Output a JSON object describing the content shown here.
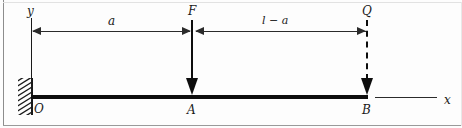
{
  "figure": {
    "kind": "cantilever-beam-free-body-diagram",
    "colors": {
      "line": "#0d0d0d",
      "dimension": "#2b2b2b",
      "frame": "#8d8d8d",
      "background": "#fdfdfd"
    }
  },
  "axes": {
    "y_label": "y",
    "x_label": "x",
    "origin_label": "O"
  },
  "points": {
    "a_label": "A",
    "b_label": "B"
  },
  "forces": [
    {
      "label": "F",
      "style": "solid",
      "direction": "down",
      "applied_at": "A"
    },
    {
      "label": "Q",
      "style": "dashed",
      "direction": "down",
      "applied_at": "B"
    }
  ],
  "dimensions": [
    {
      "label": "a",
      "from": "O",
      "to": "A"
    },
    {
      "label": "l − a",
      "from": "A",
      "to": "B"
    }
  ],
  "support": {
    "type": "fixed-wall-hatched",
    "at": "O"
  }
}
